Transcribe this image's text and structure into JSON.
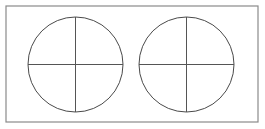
{
  "canvas": {
    "width": 265,
    "height": 129,
    "background_color": "#ffffff"
  },
  "frame": {
    "label": "outer-rectangle",
    "x": 6,
    "y": 6,
    "width": 252,
    "height": 116,
    "stroke_color": "#8a8a8a",
    "stroke_width": 1.2,
    "fill_color": "#ffffff"
  },
  "shapes": {
    "stroke_color": "#4a4a4a",
    "line_color": "#555555",
    "stroke_width": 1,
    "circles": [
      {
        "label": "left-circle",
        "cx": 75.5,
        "cy": 64.5,
        "r": 47.5,
        "vertical_line": {
          "x1": 75.5,
          "y1": 17,
          "x2": 75.5,
          "y2": 112
        },
        "horizontal_line": {
          "x1": 28,
          "y1": 64.5,
          "x2": 123,
          "y2": 64.5
        }
      },
      {
        "label": "right-circle",
        "cx": 186.5,
        "cy": 64.5,
        "r": 47.5,
        "vertical_line": {
          "x1": 186.5,
          "y1": 17,
          "x2": 186.5,
          "y2": 112
        },
        "horizontal_line": {
          "x1": 139,
          "y1": 64.5,
          "x2": 234,
          "y2": 64.5
        }
      }
    ]
  }
}
